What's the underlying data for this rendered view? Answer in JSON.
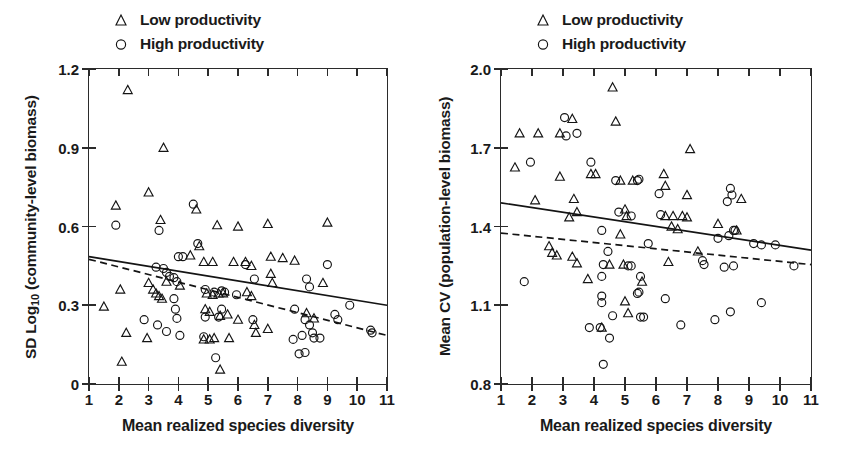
{
  "figure": {
    "panels": [
      "left",
      "right"
    ]
  },
  "legend": {
    "items": [
      {
        "symbol": "triangle",
        "label": "Low productivity"
      },
      {
        "symbol": "circle",
        "label": "High productivity"
      }
    ]
  },
  "left_panel": {
    "y_axis_title_prefix": "SD Log",
    "y_axis_title_sub": "10",
    "y_axis_title_suffix": " (community-level biomass)",
    "x_axis_title": "Mean realized species diversity",
    "y_ticks": [
      "1.2",
      "0.9",
      "0.6",
      "0.3",
      "0"
    ],
    "x_ticks": [
      "1",
      "2",
      "3",
      "4",
      "5",
      "6",
      "7",
      "8",
      "9",
      "10",
      "11"
    ]
  },
  "right_panel": {
    "y_axis_title": "Mean CV (population-level biomass)",
    "x_axis_title": "Mean realized species diversity",
    "y_ticks": [
      "2.0",
      "1.7",
      "1.4",
      "1.1",
      "0.8"
    ],
    "x_ticks": [
      "1",
      "2",
      "3",
      "4",
      "5",
      "6",
      "7",
      "8",
      "9",
      "10",
      "11"
    ]
  },
  "chart_data": [
    {
      "panel": "left",
      "type": "scatter",
      "title": "",
      "xlabel": "Mean realized species diversity",
      "ylabel": "SD Log10 (community-level biomass)",
      "xlim": [
        1,
        11
      ],
      "ylim": [
        0,
        1.2
      ],
      "xticks": [
        1,
        2,
        3,
        4,
        5,
        6,
        7,
        8,
        9,
        10,
        11
      ],
      "yticks": [
        0,
        0.3,
        0.6,
        0.9,
        1.2
      ],
      "grid": false,
      "legend_position": "above-plot",
      "series": [
        {
          "name": "Low productivity",
          "marker": "triangle",
          "points": [
            [
              2.3,
              1.12
            ],
            [
              3.5,
              0.9
            ],
            [
              3.0,
              0.73
            ],
            [
              1.9,
              0.68
            ],
            [
              3.4,
              0.625
            ],
            [
              4.6,
              0.665
            ],
            [
              5.3,
              0.605
            ],
            [
              6.0,
              0.6
            ],
            [
              7.0,
              0.61
            ],
            [
              9.0,
              0.615
            ],
            [
              4.7,
              0.525
            ],
            [
              4.4,
              0.49
            ],
            [
              4.85,
              0.465
            ],
            [
              5.15,
              0.465
            ],
            [
              5.85,
              0.465
            ],
            [
              6.25,
              0.465
            ],
            [
              6.45,
              0.45
            ],
            [
              7.1,
              0.485
            ],
            [
              7.5,
              0.48
            ],
            [
              7.9,
              0.47
            ],
            [
              2.05,
              0.36
            ],
            [
              1.5,
              0.295
            ],
            [
              3.0,
              0.385
            ],
            [
              3.15,
              0.36
            ],
            [
              3.25,
              0.345
            ],
            [
              3.35,
              0.335
            ],
            [
              3.45,
              0.325
            ],
            [
              3.6,
              0.39
            ],
            [
              4.05,
              0.375
            ],
            [
              4.95,
              0.345
            ],
            [
              5.15,
              0.34
            ],
            [
              5.35,
              0.345
            ],
            [
              5.5,
              0.345
            ],
            [
              6.3,
              0.35
            ],
            [
              6.45,
              0.335
            ],
            [
              7.1,
              0.42
            ],
            [
              7.15,
              0.385
            ],
            [
              8.85,
              0.385
            ],
            [
              4.9,
              0.285
            ],
            [
              5.05,
              0.275
            ],
            [
              5.4,
              0.26
            ],
            [
              5.65,
              0.265
            ],
            [
              6.0,
              0.245
            ],
            [
              6.55,
              0.225
            ],
            [
              7.0,
              0.21
            ],
            [
              6.6,
              0.195
            ],
            [
              8.3,
              0.27
            ],
            [
              8.55,
              0.25
            ],
            [
              2.25,
              0.195
            ],
            [
              2.95,
              0.175
            ],
            [
              4.85,
              0.17
            ],
            [
              5.05,
              0.17
            ],
            [
              5.2,
              0.175
            ],
            [
              5.7,
              0.175
            ],
            [
              2.1,
              0.085
            ],
            [
              5.4,
              0.055
            ]
          ]
        },
        {
          "name": "High productivity",
          "marker": "circle",
          "points": [
            [
              1.9,
              0.605
            ],
            [
              3.35,
              0.585
            ],
            [
              4.5,
              0.685
            ],
            [
              4.65,
              0.535
            ],
            [
              3.25,
              0.445
            ],
            [
              4.0,
              0.485
            ],
            [
              4.15,
              0.485
            ],
            [
              3.5,
              0.44
            ],
            [
              3.6,
              0.425
            ],
            [
              3.7,
              0.41
            ],
            [
              3.85,
              0.405
            ],
            [
              3.95,
              0.39
            ],
            [
              6.25,
              0.455
            ],
            [
              6.55,
              0.4
            ],
            [
              9.0,
              0.455
            ],
            [
              8.3,
              0.4
            ],
            [
              8.4,
              0.37
            ],
            [
              2.85,
              0.245
            ],
            [
              3.3,
              0.225
            ],
            [
              3.85,
              0.325
            ],
            [
              3.9,
              0.285
            ],
            [
              3.95,
              0.25
            ],
            [
              3.6,
              0.2
            ],
            [
              4.05,
              0.185
            ],
            [
              4.9,
              0.36
            ],
            [
              5.2,
              0.35
            ],
            [
              5.45,
              0.355
            ],
            [
              5.55,
              0.35
            ],
            [
              5.95,
              0.34
            ],
            [
              5.45,
              0.285
            ],
            [
              4.9,
              0.255
            ],
            [
              5.35,
              0.255
            ],
            [
              6.5,
              0.245
            ],
            [
              7.9,
              0.285
            ],
            [
              8.25,
              0.245
            ],
            [
              8.4,
              0.225
            ],
            [
              8.5,
              0.195
            ],
            [
              8.55,
              0.175
            ],
            [
              8.75,
              0.175
            ],
            [
              7.85,
              0.17
            ],
            [
              8.15,
              0.185
            ],
            [
              9.25,
              0.265
            ],
            [
              9.35,
              0.245
            ],
            [
              9.75,
              0.3
            ],
            [
              10.45,
              0.205
            ],
            [
              10.5,
              0.195
            ],
            [
              8.05,
              0.115
            ],
            [
              8.25,
              0.12
            ],
            [
              5.25,
              0.1
            ],
            [
              4.85,
              0.18
            ]
          ]
        }
      ],
      "fits": [
        {
          "name": "Low productivity fit",
          "style": "solid",
          "x": [
            1,
            11
          ],
          "y": [
            0.485,
            0.3
          ]
        },
        {
          "name": "High productivity fit",
          "style": "dashed",
          "x": [
            1,
            11
          ],
          "y": [
            0.475,
            0.185
          ]
        }
      ]
    },
    {
      "panel": "right",
      "type": "scatter",
      "title": "",
      "xlabel": "Mean realized species diversity",
      "ylabel": "Mean CV (population-level biomass)",
      "xlim": [
        1,
        11
      ],
      "ylim": [
        0.8,
        2.0
      ],
      "xticks": [
        1,
        2,
        3,
        4,
        5,
        6,
        7,
        8,
        9,
        10,
        11
      ],
      "yticks": [
        0.8,
        1.1,
        1.4,
        1.7,
        2.0
      ],
      "grid": false,
      "legend_position": "above-plot",
      "series": [
        {
          "name": "Low productivity",
          "marker": "triangle",
          "points": [
            [
              4.6,
              1.93
            ],
            [
              3.3,
              1.81
            ],
            [
              4.7,
              1.8
            ],
            [
              1.6,
              1.755
            ],
            [
              2.2,
              1.755
            ],
            [
              2.9,
              1.755
            ],
            [
              7.1,
              1.695
            ],
            [
              1.45,
              1.625
            ],
            [
              2.9,
              1.59
            ],
            [
              3.9,
              1.6
            ],
            [
              4.05,
              1.6
            ],
            [
              4.85,
              1.575
            ],
            [
              5.25,
              1.575
            ],
            [
              6.25,
              1.6
            ],
            [
              6.3,
              1.555
            ],
            [
              2.1,
              1.5
            ],
            [
              3.35,
              1.505
            ],
            [
              7.0,
              1.52
            ],
            [
              8.75,
              1.505
            ],
            [
              3.2,
              1.435
            ],
            [
              3.45,
              1.455
            ],
            [
              5.0,
              1.465
            ],
            [
              5.05,
              1.44
            ],
            [
              6.3,
              1.44
            ],
            [
              6.55,
              1.44
            ],
            [
              6.85,
              1.44
            ],
            [
              7.0,
              1.435
            ],
            [
              6.5,
              1.4
            ],
            [
              6.7,
              1.39
            ],
            [
              8.0,
              1.41
            ],
            [
              8.6,
              1.385
            ],
            [
              4.85,
              1.37
            ],
            [
              2.55,
              1.325
            ],
            [
              2.65,
              1.3
            ],
            [
              2.8,
              1.29
            ],
            [
              3.3,
              1.285
            ],
            [
              3.45,
              1.26
            ],
            [
              4.5,
              1.255
            ],
            [
              4.95,
              1.255
            ],
            [
              7.35,
              1.305
            ],
            [
              6.4,
              1.265
            ],
            [
              3.8,
              1.2
            ],
            [
              5.55,
              1.19
            ],
            [
              5.0,
              1.115
            ],
            [
              5.1,
              1.07
            ],
            [
              4.25,
              1.015
            ]
          ]
        },
        {
          "name": "High productivity",
          "marker": "circle",
          "points": [
            [
              3.05,
              1.815
            ],
            [
              3.45,
              1.755
            ],
            [
              3.1,
              1.745
            ],
            [
              1.95,
              1.645
            ],
            [
              3.9,
              1.645
            ],
            [
              4.7,
              1.575
            ],
            [
              5.4,
              1.575
            ],
            [
              5.45,
              1.58
            ],
            [
              6.1,
              1.525
            ],
            [
              8.4,
              1.545
            ],
            [
              8.45,
              1.52
            ],
            [
              8.3,
              1.495
            ],
            [
              4.8,
              1.455
            ],
            [
              5.2,
              1.44
            ],
            [
              6.15,
              1.445
            ],
            [
              8.5,
              1.385
            ],
            [
              8.55,
              1.385
            ],
            [
              4.25,
              1.385
            ],
            [
              8.0,
              1.355
            ],
            [
              8.35,
              1.365
            ],
            [
              9.15,
              1.335
            ],
            [
              9.4,
              1.33
            ],
            [
              9.85,
              1.33
            ],
            [
              4.45,
              1.305
            ],
            [
              5.75,
              1.335
            ],
            [
              4.3,
              1.255
            ],
            [
              5.1,
              1.25
            ],
            [
              5.2,
              1.25
            ],
            [
              7.5,
              1.27
            ],
            [
              7.55,
              1.255
            ],
            [
              8.5,
              1.25
            ],
            [
              10.45,
              1.25
            ],
            [
              8.2,
              1.245
            ],
            [
              4.25,
              1.21
            ],
            [
              5.5,
              1.21
            ],
            [
              1.75,
              1.19
            ],
            [
              5.4,
              1.145
            ],
            [
              5.45,
              1.15
            ],
            [
              4.25,
              1.135
            ],
            [
              4.25,
              1.11
            ],
            [
              6.3,
              1.125
            ],
            [
              9.4,
              1.11
            ],
            [
              4.6,
              1.06
            ],
            [
              5.5,
              1.055
            ],
            [
              5.6,
              1.055
            ],
            [
              7.9,
              1.045
            ],
            [
              8.4,
              1.075
            ],
            [
              6.8,
              1.025
            ],
            [
              3.85,
              1.015
            ],
            [
              4.2,
              1.015
            ],
            [
              4.5,
              0.975
            ],
            [
              4.3,
              0.875
            ]
          ]
        }
      ],
      "fits": [
        {
          "name": "Low productivity fit",
          "style": "solid",
          "x": [
            1,
            11
          ],
          "y": [
            1.49,
            1.31
          ]
        },
        {
          "name": "High productivity fit",
          "style": "dashed",
          "x": [
            1,
            11
          ],
          "y": [
            1.375,
            1.255
          ]
        }
      ]
    }
  ]
}
